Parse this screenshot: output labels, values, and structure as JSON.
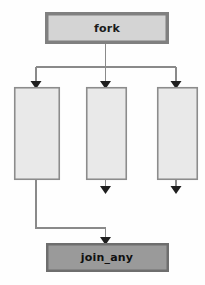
{
  "diagram": {
    "background_color": "#fefefe",
    "nodes": {
      "fork": {
        "label": "fork",
        "shape": "rectangle",
        "fill_color": "#d4d4d4",
        "border_color": "#808080",
        "x": 46,
        "y": 13,
        "width": 122,
        "height": 30
      },
      "branch_1": {
        "label": "",
        "shape": "rectangle",
        "fill_color": "#e9e9e9",
        "border_color": "#8c8c8c",
        "x": 14,
        "y": 87,
        "width": 46,
        "height": 93
      },
      "branch_2": {
        "label": "",
        "shape": "rectangle",
        "fill_color": "#e9e9e9",
        "border_color": "#8c8c8c",
        "x": 86,
        "y": 87,
        "width": 41,
        "height": 93
      },
      "branch_3": {
        "label": "",
        "shape": "rectangle",
        "fill_color": "#e9e9e9",
        "border_color": "#8c8c8c",
        "x": 157,
        "y": 87,
        "width": 41,
        "height": 93
      },
      "join_any": {
        "label": "join_any",
        "shape": "rectangle",
        "fill_color": "#9a9a9a",
        "border_color": "#6e6e6e",
        "x": 46,
        "y": 243,
        "width": 122,
        "height": 28
      }
    },
    "edges": [
      {
        "name": "fork-to-split",
        "from": "fork",
        "to": "split-bar",
        "arrow": false
      },
      {
        "name": "split-to-branch-1",
        "from": "split-bar",
        "to": "branch_1",
        "arrow": true
      },
      {
        "name": "split-to-branch-2",
        "from": "split-bar",
        "to": "branch_2",
        "arrow": true
      },
      {
        "name": "split-to-branch-3",
        "from": "split-bar",
        "to": "branch_3",
        "arrow": true
      },
      {
        "name": "branch-1-to-join",
        "from": "branch_1",
        "to": "join_any",
        "arrow": true
      },
      {
        "name": "branch-2-dangling",
        "from": "branch_2",
        "to": "",
        "arrow": true
      },
      {
        "name": "branch-3-dangling",
        "from": "branch_3",
        "to": "",
        "arrow": true
      }
    ],
    "edge_color": "#8a8a8a",
    "arrow_color": "#1f1f1f"
  }
}
